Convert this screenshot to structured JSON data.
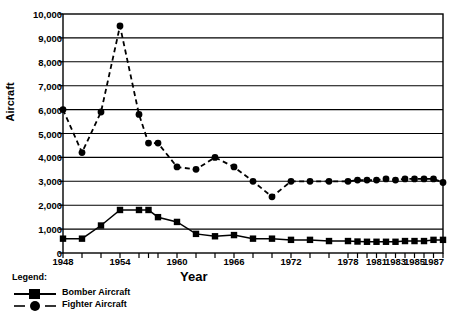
{
  "chart_data": {
    "type": "line",
    "title": "",
    "xlabel": "Year",
    "ylabel": "Aircraft",
    "ylim": [
      0,
      10000
    ],
    "ytick_labels": [
      "0",
      "1,000",
      "2,000",
      "3,000",
      "4,000",
      "5,000",
      "6,000",
      "7,000",
      "8,000",
      "9,000",
      "10,000"
    ],
    "ytick_values": [
      0,
      1000,
      2000,
      3000,
      4000,
      5000,
      6000,
      7000,
      8000,
      9000,
      10000
    ],
    "grid": true,
    "legend_position": "below-left",
    "legend_title": "Legend:",
    "x": [
      1948,
      1950,
      1952,
      1954,
      1956,
      1957,
      1958,
      1960,
      1962,
      1964,
      1966,
      1968,
      1970,
      1972,
      1974,
      1976,
      1978,
      1979,
      1980,
      1981,
      1982,
      1983,
      1984,
      1985,
      1986,
      1987,
      1988
    ],
    "xtick_labels": [
      "1948",
      "1954",
      "1960",
      "1966",
      "1972",
      "1978",
      "1981",
      "1983",
      "1985",
      "1987"
    ],
    "xtick_label_positions": [
      1948,
      1954,
      1960,
      1966,
      1972,
      1978,
      1981,
      1983,
      1985,
      1987
    ],
    "series": [
      {
        "name": "Bomber Aircraft",
        "marker": "square",
        "linestyle": "solid",
        "color": "#000000",
        "values": [
          600,
          600,
          1150,
          1800,
          1800,
          1800,
          1500,
          1300,
          800,
          700,
          750,
          600,
          600,
          550,
          550,
          500,
          500,
          480,
          470,
          470,
          470,
          470,
          500,
          500,
          500,
          550,
          550
        ]
      },
      {
        "name": "Fighter Aircraft",
        "marker": "circle",
        "linestyle": "dashed",
        "color": "#000000",
        "values": [
          6000,
          4200,
          5900,
          9500,
          5800,
          4600,
          4600,
          3600,
          3500,
          4000,
          3600,
          3000,
          2350,
          3000,
          3000,
          3000,
          3000,
          3050,
          3050,
          3050,
          3100,
          3050,
          3100,
          3100,
          3100,
          3100,
          2950
        ]
      }
    ]
  },
  "legend": {
    "title": "Legend:",
    "items": [
      {
        "label": "Bomber Aircraft",
        "marker": "square",
        "linestyle": "solid"
      },
      {
        "label": "Fighter Aircraft",
        "marker": "circle",
        "linestyle": "dashed"
      }
    ]
  }
}
